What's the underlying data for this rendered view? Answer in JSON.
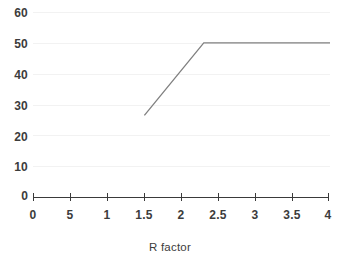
{
  "chart_data": {
    "type": "line",
    "title": "",
    "subtitle": "",
    "xlabel": "R factor",
    "ylabel": "",
    "xlim": [
      0,
      4
    ],
    "ylim": [
      0,
      60
    ],
    "grid": true,
    "legend": false,
    "legend_position": "none",
    "x_tick_labels": [
      "0",
      "5",
      "1",
      "1.5",
      "2",
      "2.5",
      "3",
      "3.5",
      "4"
    ],
    "x_tick_values": [
      0,
      0.5,
      1,
      1.5,
      2,
      2.5,
      3,
      3.5,
      4
    ],
    "y_tick_labels": [
      "0",
      "10",
      "20",
      "30",
      "40",
      "50",
      "60"
    ],
    "y_tick_values": [
      0,
      10,
      20,
      30,
      40,
      50,
      60
    ],
    "series": [
      {
        "name": "R factor response",
        "color": "#808080",
        "x": [
          1.5,
          2.3,
          4.0
        ],
        "values": [
          26.5,
          50.0,
          50.0
        ]
      }
    ],
    "annotations": []
  },
  "axis": {
    "x_title": "R factor"
  },
  "colors": {
    "line": "#808080",
    "axis": "#3a3a3a",
    "grid": "#f2f2f2",
    "text": "#3c3c3c",
    "background": "#ffffff"
  }
}
